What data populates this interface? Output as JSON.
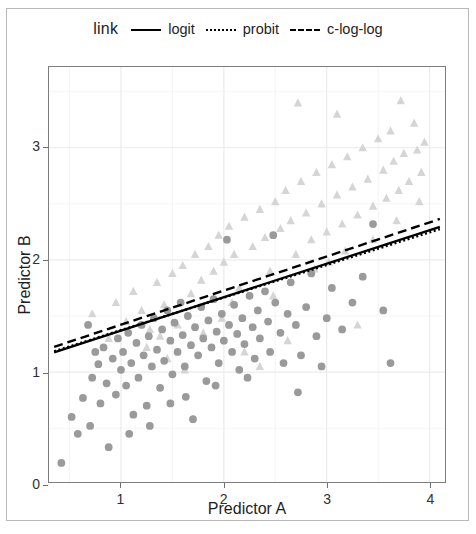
{
  "legend": {
    "title": "link",
    "entries": [
      {
        "label": "logit",
        "style": "solid"
      },
      {
        "label": "probit",
        "style": "dotted"
      },
      {
        "label": "c-log-log",
        "style": "dashed"
      }
    ]
  },
  "chart_data": {
    "type": "scatter",
    "title": "",
    "xlabel": "Predictor A",
    "ylabel": "Predictor B",
    "xlim": [
      0.3,
      4.15
    ],
    "ylim": [
      0.02,
      3.72
    ],
    "xticks": [
      1,
      2,
      3,
      4
    ],
    "yticks": [
      0,
      1,
      2,
      3
    ],
    "xticklabels": [
      "1",
      "2",
      "3",
      "4"
    ],
    "yticklabels": [
      "0",
      "1",
      "2",
      "3"
    ],
    "grid": true,
    "grid_minor": true,
    "legend_position": "top",
    "colors": {
      "circle": "#9a9a9a",
      "triangle": "#d5d5d5",
      "line": "#000000",
      "panel_border": "#7d7d7d",
      "grid_major": "#ebebeb",
      "grid_minor": "#f4f4f4",
      "outer_frame": "#b9b9b9"
    },
    "series": [
      {
        "name": "group-circle",
        "marker": "circle",
        "color": "#9a9a9a",
        "points": [
          [
            0.42,
            0.19
          ],
          [
            0.52,
            0.6
          ],
          [
            0.58,
            0.45
          ],
          [
            0.63,
            0.77
          ],
          [
            0.7,
            0.52
          ],
          [
            0.72,
            0.95
          ],
          [
            0.78,
            1.07
          ],
          [
            0.8,
            0.72
          ],
          [
            0.83,
            1.22
          ],
          [
            0.86,
            0.9
          ],
          [
            0.88,
            0.33
          ],
          [
            0.92,
            1.12
          ],
          [
            0.95,
            0.8
          ],
          [
            0.97,
            1.3
          ],
          [
            1.0,
            1.02
          ],
          [
            1.02,
            1.18
          ],
          [
            1.05,
            0.88
          ],
          [
            1.07,
            1.35
          ],
          [
            1.1,
            1.08
          ],
          [
            1.12,
            0.62
          ],
          [
            1.15,
            1.26
          ],
          [
            1.17,
            0.95
          ],
          [
            1.2,
            1.42
          ],
          [
            1.22,
            1.15
          ],
          [
            1.25,
            0.7
          ],
          [
            1.27,
            1.32
          ],
          [
            1.3,
            1.05
          ],
          [
            1.32,
            1.48
          ],
          [
            1.35,
            1.2
          ],
          [
            1.38,
            0.86
          ],
          [
            1.4,
            1.38
          ],
          [
            1.42,
            1.1
          ],
          [
            1.45,
            1.55
          ],
          [
            1.48,
            1.28
          ],
          [
            1.5,
            0.98
          ],
          [
            1.52,
            1.44
          ],
          [
            1.55,
            1.18
          ],
          [
            1.58,
            1.62
          ],
          [
            1.6,
            1.33
          ],
          [
            1.62,
            1.05
          ],
          [
            1.65,
            1.5
          ],
          [
            1.68,
            1.24
          ],
          [
            1.7,
            0.58
          ],
          [
            1.72,
            1.4
          ],
          [
            1.75,
            1.15
          ],
          [
            1.78,
            1.58
          ],
          [
            1.8,
            1.3
          ],
          [
            1.83,
            0.92
          ],
          [
            1.85,
            1.46
          ],
          [
            1.88,
            1.22
          ],
          [
            1.9,
            1.65
          ],
          [
            1.93,
            1.36
          ],
          [
            1.95,
            1.08
          ],
          [
            1.98,
            1.52
          ],
          [
            2.0,
            1.28
          ],
          [
            2.03,
            2.18
          ],
          [
            2.05,
            1.42
          ],
          [
            2.08,
            1.18
          ],
          [
            2.1,
            1.6
          ],
          [
            2.13,
            1.34
          ],
          [
            2.15,
            1.02
          ],
          [
            2.18,
            1.48
          ],
          [
            2.2,
            1.25
          ],
          [
            2.25,
            1.68
          ],
          [
            2.28,
            1.4
          ],
          [
            2.3,
            1.12
          ],
          [
            2.33,
            1.55
          ],
          [
            2.35,
            1.3
          ],
          [
            2.4,
            1.72
          ],
          [
            2.43,
            1.45
          ],
          [
            2.45,
            1.18
          ],
          [
            2.5,
            1.62
          ],
          [
            2.55,
            1.35
          ],
          [
            2.58,
            1.08
          ],
          [
            2.62,
            1.52
          ],
          [
            2.65,
            1.8
          ],
          [
            2.7,
            1.42
          ],
          [
            2.75,
            1.15
          ],
          [
            2.8,
            1.58
          ],
          [
            2.85,
            1.88
          ],
          [
            2.9,
            1.32
          ],
          [
            2.95,
            1.05
          ],
          [
            3.0,
            1.48
          ],
          [
            3.05,
            1.75
          ],
          [
            3.15,
            1.38
          ],
          [
            3.25,
            1.62
          ],
          [
            3.35,
            1.85
          ],
          [
            3.45,
            2.32
          ],
          [
            3.55,
            1.55
          ],
          [
            3.62,
            1.08
          ],
          [
            0.68,
            1.42
          ],
          [
            0.75,
            1.18
          ],
          [
            1.08,
            0.45
          ],
          [
            1.28,
            0.52
          ],
          [
            1.48,
            0.72
          ],
          [
            1.63,
            0.78
          ],
          [
            1.92,
            0.88
          ],
          [
            2.23,
            0.95
          ],
          [
            2.48,
            2.22
          ],
          [
            2.72,
            0.82
          ]
        ]
      },
      {
        "name": "group-triangle",
        "marker": "triangle",
        "color": "#d5d5d5",
        "points": [
          [
            0.72,
            1.52
          ],
          [
            0.88,
            1.3
          ],
          [
            0.95,
            1.62
          ],
          [
            1.05,
            1.45
          ],
          [
            1.12,
            1.72
          ],
          [
            1.2,
            1.55
          ],
          [
            1.28,
            1.38
          ],
          [
            1.35,
            1.8
          ],
          [
            1.42,
            1.6
          ],
          [
            1.5,
            1.88
          ],
          [
            1.55,
            1.42
          ],
          [
            1.6,
            1.95
          ],
          [
            1.68,
            1.7
          ],
          [
            1.72,
            2.05
          ],
          [
            1.78,
            1.82
          ],
          [
            1.85,
            2.12
          ],
          [
            1.9,
            1.9
          ],
          [
            1.95,
            2.22
          ],
          [
            2.0,
            1.98
          ],
          [
            2.05,
            2.3
          ],
          [
            2.1,
            2.05
          ],
          [
            2.15,
            1.75
          ],
          [
            2.2,
            2.38
          ],
          [
            2.28,
            2.12
          ],
          [
            2.35,
            2.45
          ],
          [
            2.4,
            2.2
          ],
          [
            2.45,
            1.9
          ],
          [
            2.5,
            2.52
          ],
          [
            2.55,
            2.28
          ],
          [
            2.6,
            2.62
          ],
          [
            2.65,
            2.35
          ],
          [
            2.7,
            2.05
          ],
          [
            2.75,
            2.7
          ],
          [
            2.8,
            2.42
          ],
          [
            2.85,
            2.18
          ],
          [
            2.9,
            2.78
          ],
          [
            2.95,
            2.5
          ],
          [
            3.0,
            2.25
          ],
          [
            3.05,
            2.85
          ],
          [
            3.1,
            2.58
          ],
          [
            3.15,
            2.32
          ],
          [
            3.2,
            2.92
          ],
          [
            3.25,
            2.65
          ],
          [
            3.3,
            2.4
          ],
          [
            3.35,
            3.0
          ],
          [
            3.4,
            2.72
          ],
          [
            3.45,
            2.48
          ],
          [
            3.5,
            3.08
          ],
          [
            3.55,
            2.8
          ],
          [
            3.58,
            2.55
          ],
          [
            3.62,
            3.15
          ],
          [
            3.65,
            2.88
          ],
          [
            3.7,
            2.62
          ],
          [
            3.72,
            3.42
          ],
          [
            3.75,
            2.95
          ],
          [
            3.8,
            2.7
          ],
          [
            3.85,
            3.22
          ],
          [
            3.88,
            2.98
          ],
          [
            3.92,
            2.78
          ],
          [
            3.95,
            3.05
          ],
          [
            2.2,
            1.18
          ],
          [
            2.35,
            1.05
          ],
          [
            1.45,
            1.12
          ],
          [
            1.62,
            1.02
          ],
          [
            3.3,
            1.42
          ],
          [
            2.62,
            1.28
          ],
          [
            3.02,
            1.98
          ],
          [
            3.45,
            2.18
          ],
          [
            3.68,
            2.35
          ],
          [
            3.9,
            2.52
          ],
          [
            1.98,
            1.48
          ],
          [
            2.08,
            1.62
          ],
          [
            2.48,
            1.68
          ],
          [
            2.88,
            1.92
          ],
          [
            3.18,
            2.08
          ],
          [
            1.25,
            1.22
          ],
          [
            1.38,
            1.32
          ],
          [
            2.72,
            3.4
          ],
          [
            3.1,
            3.3
          ],
          [
            1.8,
            1.35
          ]
        ]
      }
    ],
    "lines": [
      {
        "name": "logit",
        "style": "solid",
        "color": "#000000",
        "x": [
          0.35,
          4.1
        ],
        "y": [
          1.175,
          2.295
        ]
      },
      {
        "name": "probit",
        "style": "dotted",
        "color": "#000000",
        "x": [
          0.35,
          4.1
        ],
        "y": [
          1.185,
          2.275
        ]
      },
      {
        "name": "c-log-log",
        "style": "dashed",
        "color": "#000000",
        "x": [
          0.35,
          4.1
        ],
        "y": [
          1.225,
          2.365
        ]
      }
    ]
  }
}
